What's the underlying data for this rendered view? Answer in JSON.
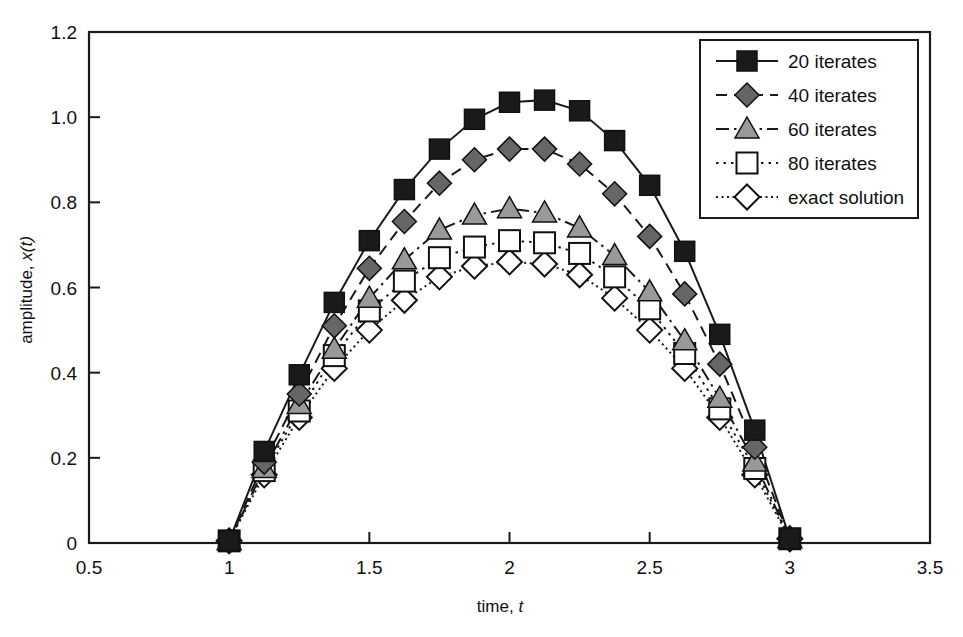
{
  "chart_data": {
    "type": "line",
    "title": "",
    "xlabel": "time, t",
    "ylabel": "amplitude, x(t)",
    "xlim": [
      0.5,
      3.5
    ],
    "ylim": [
      0.0,
      1.2
    ],
    "xticks": [
      "0.5",
      "1",
      "1.5",
      "2",
      "2.5",
      "3",
      "3.5"
    ],
    "xtick_values": [
      0.5,
      1.0,
      1.5,
      2.0,
      2.5,
      3.0,
      3.5
    ],
    "yticks": [
      "0",
      "0.2",
      "0.4",
      "0.6",
      "0.8",
      "1.0",
      "1.2"
    ],
    "ytick_values": [
      0.0,
      0.2,
      0.4,
      0.6,
      0.8,
      1.0,
      1.2
    ],
    "grid": false,
    "legend_position": "upper right",
    "x": [
      1.0,
      1.125,
      1.25,
      1.375,
      1.5,
      1.625,
      1.75,
      1.875,
      2.0,
      2.125,
      2.25,
      2.375,
      2.5,
      2.625,
      2.75,
      2.875,
      3.0
    ],
    "series": [
      {
        "name": "20 iterates",
        "marker": "filled-square",
        "marker_color": "#1a1a1a",
        "line_style": "solid",
        "line_color": "#1a1a1a",
        "values": [
          0.005,
          0.215,
          0.395,
          0.565,
          0.71,
          0.83,
          0.925,
          0.995,
          1.035,
          1.04,
          1.015,
          0.945,
          0.84,
          0.685,
          0.49,
          0.265,
          0.01
        ]
      },
      {
        "name": "40 iterates",
        "marker": "filled-diamond",
        "marker_color": "#666666",
        "line_style": "dashed",
        "line_color": "#1a1a1a",
        "values": [
          0.005,
          0.19,
          0.35,
          0.51,
          0.645,
          0.755,
          0.845,
          0.9,
          0.925,
          0.925,
          0.89,
          0.82,
          0.72,
          0.585,
          0.42,
          0.225,
          0.01
        ]
      },
      {
        "name": "60 iterates",
        "marker": "filled-triangle",
        "marker_color": "#999999",
        "line_style": "dashdot",
        "line_color": "#1a1a1a",
        "values": [
          0.005,
          0.175,
          0.325,
          0.455,
          0.575,
          0.665,
          0.735,
          0.77,
          0.785,
          0.775,
          0.74,
          0.675,
          0.59,
          0.475,
          0.34,
          0.19,
          0.01
        ]
      },
      {
        "name": "80 iterates",
        "marker": "open-square",
        "marker_color": "#ffffff",
        "line_style": "dotted",
        "line_color": "#1a1a1a",
        "values": [
          0.005,
          0.17,
          0.31,
          0.44,
          0.545,
          0.615,
          0.67,
          0.695,
          0.71,
          0.705,
          0.68,
          0.625,
          0.55,
          0.445,
          0.315,
          0.175,
          0.01
        ]
      },
      {
        "name": "exact solution",
        "marker": "open-diamond",
        "marker_color": "#ffffff",
        "line_style": "finedot",
        "line_color": "#1a1a1a",
        "values": [
          0.005,
          0.16,
          0.295,
          0.41,
          0.5,
          0.57,
          0.625,
          0.65,
          0.66,
          0.655,
          0.63,
          0.575,
          0.5,
          0.41,
          0.295,
          0.16,
          0.01
        ]
      }
    ]
  },
  "legend": {
    "entries": [
      {
        "label": "20 iterates"
      },
      {
        "label": "40 iterates"
      },
      {
        "label": "60 iterates"
      },
      {
        "label": "80 iterates"
      },
      {
        "label": "exact solution"
      }
    ]
  },
  "axes": {
    "x_label_main": "time,",
    "x_label_italic": "t",
    "y_label_main": "amplitude,",
    "y_label_italic": "x(t)"
  },
  "colors": {
    "axis": "#1a1a1a",
    "series_20": "#1a1a1a",
    "series_40": "#666666",
    "series_60": "#999999",
    "series_80": "#ffffff",
    "series_exact": "#ffffff",
    "background": "#ffffff"
  }
}
